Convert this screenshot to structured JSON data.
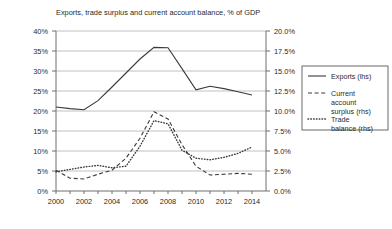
{
  "chart_data": {
    "type": "line",
    "title": "Exports, trade surplus and current account balance, % of GDP",
    "xlabel": "",
    "ylabel_left": "% of GDP",
    "ylabel_right": "% of GDP",
    "grid": true,
    "legend_position": "right-outside",
    "x": [
      2000,
      2001,
      2002,
      2003,
      2004,
      2005,
      2006,
      2007,
      2008,
      2009,
      2010,
      2011,
      2012,
      2013,
      2014
    ],
    "xlim": [
      2000,
      2015
    ],
    "x_ticks": [
      "2000",
      "2002",
      "2004",
      "2006",
      "2008",
      "2010",
      "2012",
      "2014"
    ],
    "x_tick_values": [
      2000,
      2002,
      2004,
      2006,
      2008,
      2010,
      2012,
      2014
    ],
    "ylim_left": [
      0,
      40
    ],
    "y_ticks_left": [
      "0%",
      "5%",
      "10%",
      "15%",
      "20%",
      "25%",
      "30%",
      "35%",
      "40%"
    ],
    "y_tick_values_left": [
      0,
      5,
      10,
      15,
      20,
      25,
      30,
      35,
      40
    ],
    "ylim_right": [
      0,
      20
    ],
    "y_ticks_right": [
      "0.0%",
      "2.5%",
      "5.0%",
      "7.5%",
      "10.0%",
      "12.5%",
      "15.0%",
      "17.5%",
      "20.0%"
    ],
    "y_tick_values_right": [
      0,
      2.5,
      5,
      7.5,
      10,
      12.5,
      15,
      17.5,
      20
    ],
    "series": [
      {
        "name": "Exports (lhs)",
        "axis": "left",
        "style": "solid",
        "values": [
          21.0,
          20.6,
          20.3,
          22.6,
          26.0,
          29.5,
          33.0,
          35.9,
          35.8,
          30.6,
          25.3,
          26.2,
          25.6,
          24.8,
          24.0
        ]
      },
      {
        "name": "Current account surplus (rhs)",
        "axis": "right",
        "style": "dashed",
        "values": [
          2.6,
          1.6,
          1.5,
          2.1,
          2.6,
          4.1,
          6.6,
          9.9,
          9.0,
          5.8,
          3.1,
          2.0,
          2.1,
          2.2,
          2.1
        ]
      },
      {
        "name": "Trade balance (rhs)",
        "axis": "right",
        "style": "dotted",
        "values": [
          2.4,
          2.7,
          3.0,
          3.2,
          2.9,
          3.1,
          5.6,
          8.8,
          8.4,
          5.1,
          4.1,
          3.9,
          4.2,
          4.7,
          5.5
        ]
      }
    ]
  },
  "legend": {
    "entries": [
      {
        "label": "Exports (lhs)",
        "style": "solid"
      },
      {
        "label": "Current account surplus (rhs)",
        "style": "dashed"
      },
      {
        "label": "Trade balance (rhs)",
        "style": "dotted"
      }
    ]
  },
  "colors": {
    "line": "#3a3a3a",
    "grid": "#b0b0b0",
    "axis": "#6e6e6e",
    "text": "#2a2a2a",
    "background": "#ffffff"
  }
}
